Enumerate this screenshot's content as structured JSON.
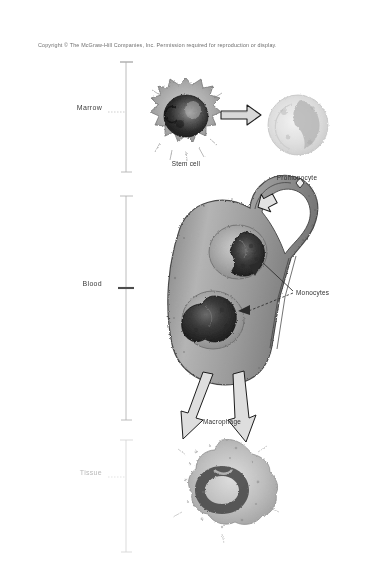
{
  "figure": {
    "copyright": "Copyright © The McGraw-Hill Companies, Inc. Permission required for reproduction or display.",
    "background_color": "#ffffff",
    "ink_color": "#3c3c3c"
  },
  "zones": [
    {
      "id": "marrow",
      "label": "Marrow",
      "bracket_top": 62,
      "bracket_bottom": 172,
      "label_y": 108
    },
    {
      "id": "blood",
      "label": "Blood",
      "bracket_top": 196,
      "bracket_bottom": 420,
      "label_y": 284
    },
    {
      "id": "tissue",
      "label": "Tissue",
      "bracket_top": 440,
      "bracket_bottom": 552,
      "label_y": 473,
      "faint": true
    }
  ],
  "cells": [
    {
      "id": "stem-cell",
      "caption": "Stem cell",
      "caption_x": 186,
      "caption_y": 165,
      "cx": 186,
      "cy": 118,
      "zone": "marrow",
      "description": "Round cell with large dark nucleus and spiky cytoplasmic projections"
    },
    {
      "id": "promonocyte",
      "caption": "Promonocyte",
      "caption_x": 296,
      "caption_y": 180,
      "cx": 296,
      "cy": 125,
      "zone": "marrow",
      "description": "Pale rounded cell with indented nucleus"
    },
    {
      "id": "monocytes",
      "caption": "Monocytes",
      "caption_x": 300,
      "caption_y": 295,
      "zone": "blood",
      "description": "Two cells with kidney-shaped nuclei travelling inside the blood vessel"
    },
    {
      "id": "macrophage",
      "caption": "Macrophage",
      "caption_x": 222,
      "caption_y": 425,
      "cx": 222,
      "cy": 490,
      "zone": "tissue",
      "description": "Large irregular amoeboid cell with ring-shaped nucleus"
    }
  ],
  "arrows": [
    {
      "id": "stem-to-promonocyte",
      "kind": "block-arrow",
      "direction": "right",
      "from": "stem-cell",
      "to": "promonocyte"
    },
    {
      "id": "promonocyte-to-vessel",
      "kind": "block-arrow",
      "direction": "down-left",
      "from": "promonocyte",
      "to": "blood-vessel"
    },
    {
      "id": "monocyte-exit-left",
      "kind": "block-arrow",
      "direction": "down-left",
      "from": "blood-vessel",
      "to": "macrophage"
    },
    {
      "id": "monocyte-exit-right",
      "kind": "block-arrow",
      "direction": "down-right",
      "from": "blood-vessel",
      "to": "macrophage"
    }
  ],
  "leaders": [
    {
      "id": "leader-monocyte-upper",
      "from_label": "Monocytes",
      "to_cell": "monocyte-upper"
    },
    {
      "id": "leader-monocyte-lower",
      "from_label": "Monocytes",
      "to_cell": "monocyte-lower"
    }
  ],
  "vessel": {
    "id": "blood-vessel",
    "label": "",
    "description": "Looped blood vessel shown in cutaway containing two monocytes"
  }
}
